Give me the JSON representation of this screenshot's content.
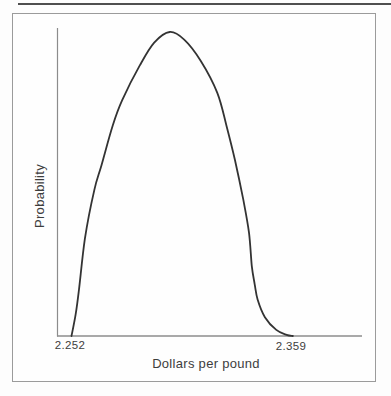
{
  "figure": {
    "y_axis_label": "Probability",
    "x_axis_label": "Dollars per pound",
    "tick_left": "2.252",
    "tick_right": "2.359"
  },
  "colors": {
    "background": "#fdfdfd",
    "frame_border": "#9b9b9b",
    "top_rule": "#4f4f4f",
    "axis": "#8c8c8c",
    "curve": "#333333",
    "text": "#3d3d3d"
  },
  "chart_data": {
    "type": "line",
    "title": "",
    "xlabel": "Dollars per pound",
    "ylabel": "Probability",
    "x_tick_labels": [
      "2.252",
      "2.359"
    ],
    "xlim": [
      2.252,
      2.359
    ],
    "ylim": [
      0,
      1
    ],
    "grid": false,
    "legend": false,
    "series": [
      {
        "name": "probability-density",
        "points": [
          [
            2.252,
            0.0
          ],
          [
            2.254,
            0.07
          ],
          [
            2.2555,
            0.145
          ],
          [
            2.2585,
            0.32
          ],
          [
            2.263,
            0.48
          ],
          [
            2.2665,
            0.562
          ],
          [
            2.272,
            0.694
          ],
          [
            2.2765,
            0.776
          ],
          [
            2.285,
            0.89
          ],
          [
            2.292,
            0.965
          ],
          [
            2.2995,
            1.0
          ],
          [
            2.3065,
            0.975
          ],
          [
            2.3145,
            0.905
          ],
          [
            2.3225,
            0.8
          ],
          [
            2.327,
            0.69
          ],
          [
            2.331,
            0.58
          ],
          [
            2.335,
            0.45
          ],
          [
            2.3378,
            0.34
          ],
          [
            2.3392,
            0.23
          ],
          [
            2.3406,
            0.17
          ],
          [
            2.342,
            0.12
          ],
          [
            2.3455,
            0.062
          ],
          [
            2.351,
            0.02
          ],
          [
            2.356,
            0.004
          ],
          [
            2.359,
            0.0
          ]
        ]
      }
    ]
  }
}
